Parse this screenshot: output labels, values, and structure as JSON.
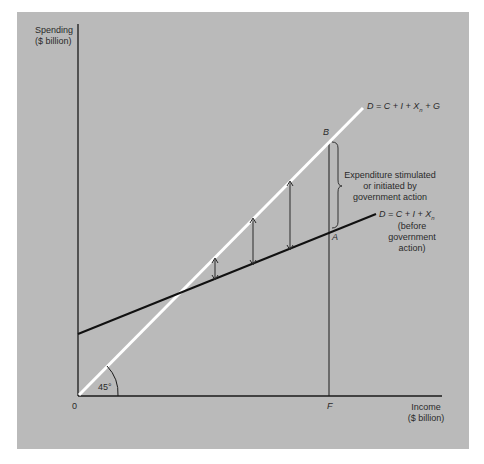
{
  "diagram": {
    "title": "",
    "y_axis": {
      "label_line1": "Spending",
      "label_line2": "($ billion)"
    },
    "x_axis": {
      "label_line1": "Income",
      "label_line2": "($ billion)"
    },
    "origin_label": "0",
    "angle_label": "45°",
    "point_labels": {
      "B": "B",
      "A": "A",
      "F": "F"
    },
    "lines": [
      {
        "id": "total-demand-with-government",
        "label": "D = C + I + X",
        "subscript": "n",
        "suffix": " + G",
        "color": "#ffffff"
      },
      {
        "id": "demand-before-government",
        "label": "D = C + I + X",
        "subscript": "n",
        "note_line1": "(before",
        "note_line2": "government",
        "note_line3": "action)",
        "color": "#111111"
      }
    ],
    "brace_annotation": {
      "line1": "Expenditure stimulated",
      "line2": "or initiated by",
      "line3": "government action"
    },
    "arrows_count": 3,
    "colors": {
      "background": "#bababa",
      "axis": "#1a1a1a",
      "guide_line": "#ffffff",
      "demand_line": "#111111"
    }
  }
}
